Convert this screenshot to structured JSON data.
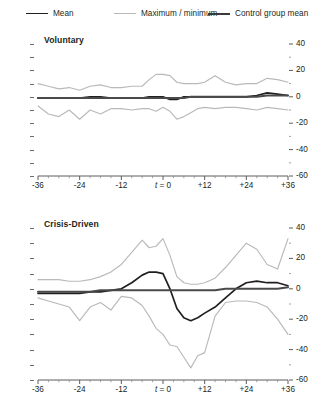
{
  "legend": {
    "items": [
      {
        "label": "Mean",
        "color": "#231f20",
        "key": "mean"
      },
      {
        "label": "Maximum / minimum",
        "color": "#b9b9b9",
        "key": "minmax"
      },
      {
        "label": "Control group mean",
        "color": "#4a4a4a",
        "key": "control"
      }
    ]
  },
  "panels": {
    "voluntary": {
      "title": "Voluntary"
    },
    "crisis": {
      "title": "Crisis-Driven"
    }
  },
  "axes": {
    "x_ticks": [
      "-36",
      "-24",
      "-12",
      "t = 0",
      "+12",
      "+24",
      "+36"
    ],
    "x_tick_values": [
      -36,
      -24,
      -12,
      0,
      12,
      24,
      36
    ],
    "x_origin_label": "t = 0",
    "y_ticks": [
      "40",
      "20",
      "0",
      "-20",
      "-40",
      "-60"
    ],
    "y_tick_values": [
      40,
      20,
      0,
      -20,
      -40,
      -60
    ]
  },
  "chart_data": [
    {
      "type": "line",
      "title": "Voluntary",
      "xlabel": "",
      "ylabel": "",
      "xlim": [
        -36,
        36
      ],
      "ylim": [
        -60,
        40
      ],
      "grid": false,
      "legend_position": "top",
      "x": [
        -36,
        -33,
        -30,
        -27,
        -24,
        -21,
        -18,
        -15,
        -12,
        -9,
        -6,
        -4,
        -2,
        0,
        2,
        4,
        6,
        8,
        10,
        12,
        15,
        18,
        21,
        24,
        27,
        30,
        33,
        36
      ],
      "series": [
        {
          "name": "Maximum",
          "color": "#b9b9b9",
          "values": [
            10,
            8,
            6,
            7,
            5,
            8,
            9,
            7,
            7,
            8,
            8,
            13,
            17,
            17,
            16,
            11,
            10,
            10,
            10,
            11,
            16,
            11,
            9,
            10,
            10,
            14,
            13,
            11
          ]
        },
        {
          "name": "Mean",
          "color": "#231f20",
          "values": [
            -1,
            -1,
            -1,
            -1,
            -1,
            0,
            0,
            -1,
            -1,
            -1,
            -1,
            0,
            0,
            0,
            -2,
            -2,
            0,
            0,
            0,
            0,
            0,
            0,
            0,
            0,
            1,
            3,
            2,
            1
          ]
        },
        {
          "name": "Control group mean",
          "color": "#4a4a4a",
          "values": [
            -1,
            -1,
            -1,
            -1,
            -1,
            -1,
            -1,
            -1,
            -1,
            -1,
            -1,
            -1,
            -1,
            -1,
            -1,
            -1,
            -1,
            0,
            0,
            0,
            0,
            0,
            0,
            0,
            0,
            1,
            1,
            1
          ]
        },
        {
          "name": "Minimum",
          "color": "#b9b9b9",
          "values": [
            -7,
            -13,
            -15,
            -10,
            -17,
            -10,
            -13,
            -9,
            -9,
            -10,
            -9,
            -9,
            -11,
            -8,
            -11,
            -17,
            -15,
            -12,
            -9,
            -8,
            -9,
            -8,
            -8,
            -9,
            -10,
            -8,
            -9,
            -10
          ]
        }
      ]
    },
    {
      "type": "line",
      "title": "Crisis-Driven",
      "xlabel": "",
      "ylabel": "",
      "xlim": [
        -36,
        36
      ],
      "ylim": [
        -60,
        40
      ],
      "grid": false,
      "legend_position": "top",
      "x": [
        -36,
        -33,
        -30,
        -27,
        -24,
        -21,
        -18,
        -15,
        -12,
        -9,
        -6,
        -4,
        -2,
        0,
        2,
        4,
        6,
        8,
        10,
        12,
        15,
        18,
        21,
        24,
        27,
        30,
        33,
        36
      ],
      "series": [
        {
          "name": "Maximum",
          "color": "#b9b9b9",
          "values": [
            6,
            6,
            6,
            5,
            5,
            6,
            8,
            11,
            16,
            24,
            32,
            27,
            28,
            33,
            22,
            8,
            4,
            3,
            3,
            4,
            7,
            14,
            22,
            30,
            26,
            16,
            13,
            33
          ]
        },
        {
          "name": "Mean",
          "color": "#231f20",
          "values": [
            -3,
            -3,
            -3,
            -3,
            -3,
            -2,
            -2,
            -1,
            0,
            4,
            9,
            11,
            11,
            10,
            0,
            -13,
            -19,
            -21,
            -19,
            -16,
            -12,
            -6,
            0,
            4,
            5,
            4,
            4,
            2
          ]
        },
        {
          "name": "Control group mean",
          "color": "#4a4a4a",
          "values": [
            -2,
            -2,
            -2,
            -2,
            -2,
            -2,
            -1,
            -1,
            -1,
            -1,
            -1,
            -1,
            -1,
            -1,
            -1,
            -1,
            -1,
            -1,
            -1,
            -1,
            -1,
            0,
            0,
            0,
            0,
            0,
            0,
            1
          ]
        },
        {
          "name": "Minimum",
          "color": "#b9b9b9",
          "values": [
            -6,
            -8,
            -10,
            -12,
            -21,
            -12,
            -9,
            -14,
            -5,
            -6,
            -11,
            -18,
            -26,
            -30,
            -37,
            -38,
            -45,
            -52,
            -44,
            -42,
            -18,
            -9,
            -8,
            -8,
            -9,
            -12,
            -20,
            -30
          ]
        }
      ]
    }
  ]
}
